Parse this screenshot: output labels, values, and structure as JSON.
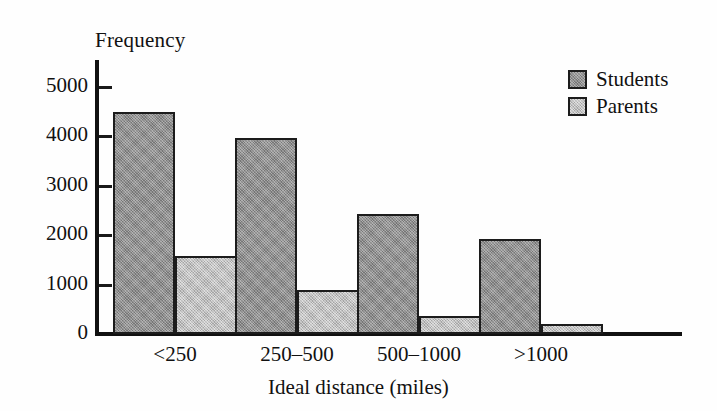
{
  "chart_data": {
    "type": "bar",
    "title": "",
    "xlabel": "Ideal distance (miles)",
    "ylabel": "Frequency",
    "categories": [
      "<250",
      "250–500",
      "500–1000",
      ">1000"
    ],
    "series": [
      {
        "name": "Students",
        "values": [
          4480,
          3960,
          2430,
          1910
        ],
        "color": "#8e8e8e"
      },
      {
        "name": "Parents",
        "values": [
          1580,
          890,
          370,
          200
        ],
        "color": "#bcbcbc"
      }
    ],
    "ylim": [
      0,
      5700
    ],
    "yticks": [
      0,
      1000,
      2000,
      3000,
      4000,
      5000
    ],
    "ytick_labels": [
      "0",
      "1000",
      "2000",
      "3000",
      "4000",
      "5000"
    ],
    "grid": false,
    "legend_position": "top-right",
    "legend_entries": [
      "Students",
      "Parents"
    ]
  },
  "axes": {
    "y_title": "Frequency",
    "x_title": "Ideal distance (miles)"
  },
  "legend": {
    "items": [
      {
        "label": "Students",
        "swatch": "students-swatch"
      },
      {
        "label": "Parents",
        "swatch": "parents-swatch"
      }
    ]
  },
  "colors": {
    "students": "#8e8e8e",
    "parents": "#bcbcbc",
    "axis": "#111111",
    "background": "#ffffff"
  }
}
